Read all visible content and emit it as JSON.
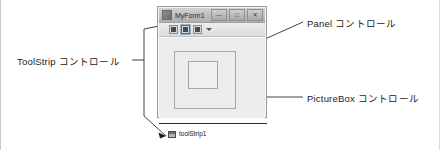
{
  "annotations": {
    "toolstrip": "ToolStrip コントロール",
    "panel": "Panel コントロール",
    "picturebox": "PictureBox コントロール"
  },
  "form": {
    "title": "MyForm1",
    "icon": "form-icon",
    "window_buttons": [
      {
        "name": "minimize",
        "glyph": "—"
      },
      {
        "name": "maximize",
        "glyph": "□"
      },
      {
        "name": "close",
        "glyph": "✕"
      }
    ],
    "toolstrip": {
      "buttons": [
        {
          "name": "toolstrip-button-1",
          "selected": false
        },
        {
          "name": "toolstrip-button-2",
          "selected": true
        },
        {
          "name": "toolstrip-button-3",
          "selected": false
        }
      ],
      "overflow": "chevron-down-icon"
    },
    "controls": {
      "panel": "Panel",
      "picturebox": "PictureBox"
    }
  },
  "tray": {
    "icon": "toolstrip-component-icon",
    "label": "toolStrip1"
  },
  "colors": {
    "form_chrome": "#e8e8e8",
    "titlebar": "#bdbdbd",
    "client": "#ececec",
    "control_border": "#a6a6a6",
    "text": "#1a1a1a",
    "leader_line": "#2b2b2b"
  }
}
